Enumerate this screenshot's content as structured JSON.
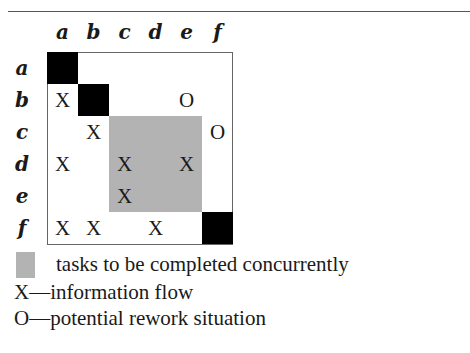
{
  "diagram": {
    "type": "design-structure-matrix",
    "columns": [
      "a",
      "b",
      "c",
      "d",
      "e",
      "f"
    ],
    "rows": [
      "a",
      "b",
      "c",
      "d",
      "e",
      "f"
    ],
    "cells": [
      {
        "row": 1,
        "col": 0,
        "mark": "X"
      },
      {
        "row": 1,
        "col": 4,
        "mark": "O"
      },
      {
        "row": 2,
        "col": 1,
        "mark": "X"
      },
      {
        "row": 2,
        "col": 5,
        "mark": "O"
      },
      {
        "row": 3,
        "col": 0,
        "mark": "X"
      },
      {
        "row": 3,
        "col": 2,
        "mark": "X"
      },
      {
        "row": 3,
        "col": 4,
        "mark": "X"
      },
      {
        "row": 4,
        "col": 2,
        "mark": "X"
      },
      {
        "row": 5,
        "col": 0,
        "mark": "X"
      },
      {
        "row": 5,
        "col": 1,
        "mark": "X"
      },
      {
        "row": 5,
        "col": 3,
        "mark": "X"
      }
    ],
    "diagonal_filled": [
      0,
      1,
      5
    ],
    "concurrent_block": {
      "from": 2,
      "to": 4,
      "color": "#b3b3b3"
    }
  },
  "legend": {
    "concurrent": "tasks to be completed concurrently",
    "x_mark": "X—information flow",
    "o_mark": "O—potential rework situation"
  }
}
